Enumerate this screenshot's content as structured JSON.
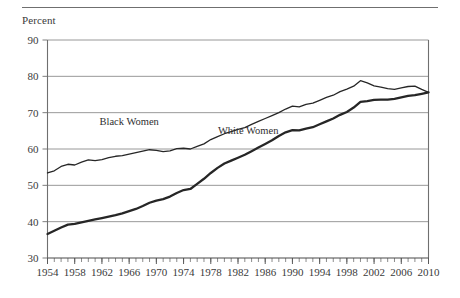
{
  "figure": {
    "axis_title": "Percent",
    "has_top_rule": true
  },
  "chart_data": {
    "type": "line",
    "title": "",
    "subtitle": "",
    "xlabel": "",
    "ylabel": "Percent",
    "ylim": [
      30,
      90
    ],
    "xlim": [
      1954,
      2010
    ],
    "yticks": [
      30,
      40,
      50,
      60,
      70,
      80,
      90
    ],
    "ytick_labels": [
      "30",
      "40",
      "50",
      "60",
      "70",
      "80",
      "90"
    ],
    "xticks": [
      1954,
      1958,
      1962,
      1966,
      1970,
      1974,
      1978,
      1982,
      1986,
      1990,
      1994,
      1998,
      2002,
      2006,
      2010
    ],
    "xtick_labels": [
      "1954",
      "1958",
      "1962",
      "1966",
      "1970",
      "1974",
      "1978",
      "1982",
      "1986",
      "1990",
      "1994",
      "1998",
      "2002",
      "2006",
      "2010"
    ],
    "minor_xtick_interval": 1,
    "grid": "horizontal",
    "legend": "inline-annotations",
    "annotations": [
      {
        "text": "Black Women",
        "x": 1966.0,
        "y": 66.5
      },
      {
        "text": "White Women",
        "x": 1983.5,
        "y": 64.0
      }
    ],
    "x": [
      1954,
      1955,
      1956,
      1957,
      1958,
      1959,
      1960,
      1961,
      1962,
      1963,
      1964,
      1965,
      1966,
      1967,
      1968,
      1969,
      1970,
      1971,
      1972,
      1973,
      1974,
      1975,
      1976,
      1977,
      1978,
      1979,
      1980,
      1981,
      1982,
      1983,
      1984,
      1985,
      1986,
      1987,
      1988,
      1989,
      1990,
      1991,
      1992,
      1993,
      1994,
      1995,
      1996,
      1997,
      1998,
      1999,
      2000,
      2001,
      2002,
      2003,
      2004,
      2005,
      2006,
      2007,
      2008,
      2009,
      2010
    ],
    "series": [
      {
        "name": "Black Women",
        "color": "#262626",
        "width": 1.3,
        "values": [
          53.4,
          54.0,
          55.2,
          55.8,
          55.6,
          56.4,
          57.0,
          56.8,
          57.1,
          57.6,
          58.0,
          58.2,
          58.6,
          59.0,
          59.4,
          59.8,
          59.6,
          59.3,
          59.5,
          60.1,
          60.2,
          60.0,
          60.7,
          61.4,
          62.6,
          63.4,
          64.2,
          64.8,
          65.4,
          65.9,
          66.8,
          67.6,
          68.4,
          69.2,
          70.0,
          71.0,
          71.8,
          71.6,
          72.3,
          72.6,
          73.4,
          74.2,
          74.8,
          75.8,
          76.5,
          77.3,
          78.8,
          78.2,
          77.4,
          77.0,
          76.6,
          76.4,
          76.8,
          77.2,
          77.3,
          76.4,
          75.6
        ]
      },
      {
        "name": "White Women",
        "color": "#262626",
        "width": 2.3,
        "values": [
          36.6,
          37.5,
          38.4,
          39.2,
          39.4,
          39.8,
          40.2,
          40.6,
          41.0,
          41.4,
          41.8,
          42.3,
          42.9,
          43.5,
          44.3,
          45.2,
          45.8,
          46.2,
          46.9,
          47.9,
          48.7,
          49.0,
          50.4,
          51.8,
          53.4,
          54.8,
          56.0,
          56.8,
          57.6,
          58.4,
          59.4,
          60.4,
          61.4,
          62.4,
          63.6,
          64.6,
          65.2,
          65.1,
          65.6,
          66.0,
          66.8,
          67.6,
          68.4,
          69.4,
          70.2,
          71.4,
          73.0,
          73.2,
          73.5,
          73.6,
          73.6,
          73.8,
          74.2,
          74.6,
          74.8,
          75.2,
          75.6
        ]
      }
    ]
  }
}
